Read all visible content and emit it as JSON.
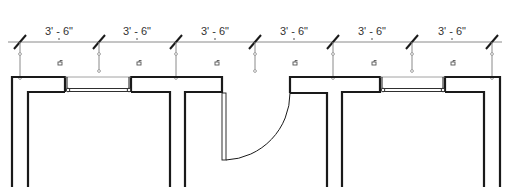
{
  "drawing": {
    "type": "architectural floor plan",
    "colors": {
      "wall": "#1a1a1a",
      "dimension": "#8a8a8a",
      "text": "#333333",
      "background": "#ffffff"
    },
    "dimensions": [
      {
        "label": "3' - 6\"",
        "from_x": 20,
        "to_x": 99
      },
      {
        "label": "3' - 6\"",
        "from_x": 99,
        "to_x": 176
      },
      {
        "label": "3' - 6\"",
        "from_x": 176,
        "to_x": 255
      },
      {
        "label": "3' - 6\"",
        "from_x": 255,
        "to_x": 333
      },
      {
        "label": "3' - 6\"",
        "from_x": 333,
        "to_x": 412
      },
      {
        "label": "3' - 6\"",
        "from_x": 412,
        "to_x": 492
      }
    ],
    "lock_icons": [
      {
        "name": "lock-icon"
      },
      {
        "name": "lock-icon"
      },
      {
        "name": "lock-icon"
      },
      {
        "name": "lock-icon"
      },
      {
        "name": "lock-icon"
      },
      {
        "name": "lock-icon"
      }
    ],
    "elements": {
      "windows": 2,
      "doors": 1
    }
  }
}
